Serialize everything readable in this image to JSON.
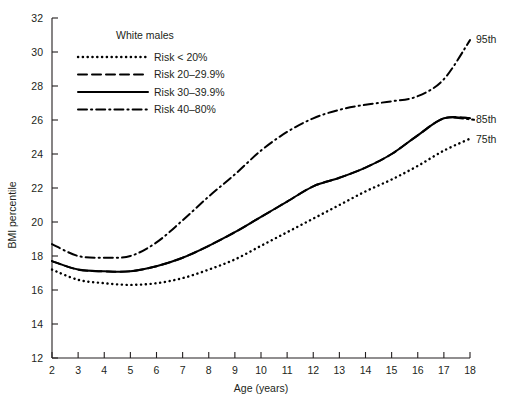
{
  "chart_data": {
    "type": "line",
    "title": "",
    "xlabel": "Age (years)",
    "ylabel": "BMI percentile",
    "xlim": [
      2,
      18
    ],
    "ylim": [
      12,
      32
    ],
    "xticks": [
      2,
      3,
      4,
      5,
      6,
      7,
      8,
      9,
      10,
      11,
      12,
      13,
      14,
      15,
      16,
      17,
      18
    ],
    "yticks": [
      12,
      14,
      16,
      18,
      20,
      22,
      24,
      26,
      28,
      30,
      32
    ],
    "grid": false,
    "legend_position": "upper-left-inside",
    "legend_title": "White males",
    "x": [
      2,
      3,
      4,
      5,
      6,
      7,
      8,
      9,
      10,
      11,
      12,
      13,
      14,
      15,
      16,
      17,
      18
    ],
    "series": [
      {
        "name": "Risk < 20%",
        "style": "dotted",
        "end_label": "75th",
        "values": [
          17.2,
          16.6,
          16.4,
          16.3,
          16.4,
          16.7,
          17.2,
          17.8,
          18.6,
          19.4,
          20.2,
          21.0,
          21.8,
          22.5,
          23.3,
          24.2,
          24.9
        ]
      },
      {
        "name": "Risk 20–29.9%",
        "style": "dashed",
        "end_label": "85th",
        "values": [
          17.7,
          17.2,
          17.1,
          17.1,
          17.4,
          17.9,
          18.6,
          19.4,
          20.3,
          21.2,
          22.1,
          22.6,
          23.2,
          24.0,
          25.1,
          26.1,
          26.1
        ]
      },
      {
        "name": "Risk 30–39.9%",
        "style": "solid",
        "end_label": "",
        "values": [
          17.7,
          17.2,
          17.1,
          17.1,
          17.4,
          17.9,
          18.6,
          19.4,
          20.3,
          21.2,
          22.1,
          22.6,
          23.2,
          24.0,
          25.1,
          26.1,
          26.1
        ]
      },
      {
        "name": "Risk 40–80%",
        "style": "dash-dot",
        "end_label": "95th",
        "values": [
          18.7,
          18.0,
          17.9,
          18.0,
          18.8,
          20.1,
          21.5,
          22.8,
          24.2,
          25.3,
          26.1,
          26.6,
          26.9,
          27.1,
          27.4,
          28.4,
          30.7
        ]
      }
    ],
    "end_labels": [
      "95th",
      "85th",
      "75th"
    ],
    "colors": {
      "line": "#000000",
      "text": "#231f20",
      "background": "#ffffff"
    }
  },
  "axes": {
    "ylabel": "BMI percentile",
    "xlabel": "Age (years)",
    "yticks": [
      "32",
      "30",
      "28",
      "26",
      "24",
      "22",
      "20",
      "18",
      "16",
      "14",
      "12"
    ],
    "xticks": [
      "2",
      "3",
      "4",
      "5",
      "6",
      "7",
      "8",
      "9",
      "10",
      "11",
      "12",
      "13",
      "14",
      "15",
      "16",
      "17",
      "18"
    ]
  },
  "legend": {
    "title": "White males",
    "items": [
      {
        "label": "Risk < 20%",
        "style": "dotted"
      },
      {
        "label": "Risk 20–29.9%",
        "style": "dashed"
      },
      {
        "label": "Risk 30–39.9%",
        "style": "solid"
      },
      {
        "label": "Risk 40–80%",
        "style": "dash-dot"
      }
    ]
  },
  "annotations": {
    "p95": "95th",
    "p85": "85th",
    "p75": "75th"
  }
}
